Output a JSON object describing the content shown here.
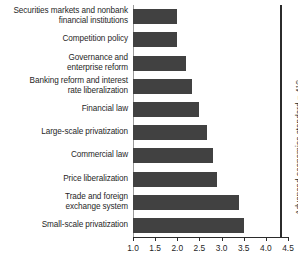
{
  "chart_data": {
    "type": "bar",
    "orientation": "horizontal",
    "title": "",
    "xlabel": "",
    "ylabel": "",
    "xlim": [
      1.0,
      4.5
    ],
    "grid": false,
    "legend": null,
    "xticks": [
      "1.0",
      "1.5",
      "2.0",
      "2.5",
      "3.0",
      "3.5",
      "4.0",
      "4.5"
    ],
    "xtick_values": [
      1.0,
      1.5,
      2.0,
      2.5,
      3.0,
      3.5,
      4.0,
      4.5
    ],
    "bar_color": "#414141",
    "categories": [
      "Securities markets and nonbank financial institutions",
      "Competition policy",
      "Governance and enterprise reform",
      "Banking reform and interest rate liberalization",
      "Financial law",
      "Large-scale privatization",
      "Commercial law",
      "Price liberalization",
      "Trade and foreign exchange system",
      "Small-scale privatization"
    ],
    "values": [
      2.0,
      2.0,
      2.2,
      2.33,
      2.5,
      2.67,
      2.8,
      2.9,
      3.4,
      3.5
    ],
    "annotations": [
      {
        "name": "advanced-economies-standard",
        "text": "Advanced economies standard = 4",
        "fraction": "1/3",
        "value": 4.33,
        "orientation": "vertical-right"
      }
    ]
  },
  "bars": [
    {
      "label_line1": "Securities markets and nonbank",
      "label_line2": "financial institutions",
      "value": 2.0
    },
    {
      "label_line1": "Competition policy",
      "label_line2": "",
      "value": 2.0
    },
    {
      "label_line1": "Governance and",
      "label_line2": "enterprise reform",
      "value": 2.2
    },
    {
      "label_line1": "Banking reform and interest",
      "label_line2": "rate liberalization",
      "value": 2.33
    },
    {
      "label_line1": "Financial law",
      "label_line2": "",
      "value": 2.5
    },
    {
      "label_line1": "Large-scale privatization",
      "label_line2": "",
      "value": 2.67
    },
    {
      "label_line1": "Commercial law",
      "label_line2": "",
      "value": 2.8
    },
    {
      "label_line1": "Price liberalization",
      "label_line2": "",
      "value": 2.9
    },
    {
      "label_line1": "Trade and foreign",
      "label_line2": "exchange system",
      "value": 3.4
    },
    {
      "label_line1": "Small-scale privatization",
      "label_line2": "",
      "value": 3.5
    }
  ],
  "reference": {
    "text": "Advanced economies standard = 4",
    "numerator": "1",
    "denominator": "3",
    "value": 4.33
  }
}
